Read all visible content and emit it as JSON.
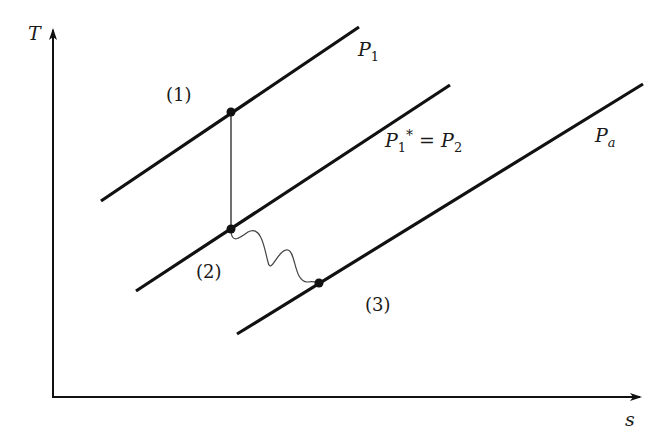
{
  "diagram": {
    "type": "T-s diagram",
    "axes": {
      "y_label": "T",
      "x_label": "s"
    },
    "isobars": [
      {
        "id": "p1",
        "label_main": "P",
        "label_sub": "1",
        "label_full": "P1"
      },
      {
        "id": "p2",
        "label_main": "P",
        "label_sub": "1",
        "label_sup": "*",
        "label_eq": " = ",
        "label_main2": "P",
        "label_sub2": "2",
        "label_full": "P1* = P2"
      },
      {
        "id": "pa",
        "label_main": "P",
        "label_sub": "a",
        "label_full": "Pa"
      }
    ],
    "states": [
      {
        "id": "state-1",
        "label": "(1)"
      },
      {
        "id": "state-2",
        "label": "(2)"
      },
      {
        "id": "state-3",
        "label": "(3)"
      }
    ],
    "processes": [
      {
        "from": "state-1",
        "to": "state-2",
        "style": "solid vertical (isentropic)"
      },
      {
        "from": "state-2",
        "to": "state-3",
        "style": "wavy (irreversible)"
      }
    ],
    "colors": {
      "line": "#111111",
      "background": "#ffffff"
    }
  }
}
